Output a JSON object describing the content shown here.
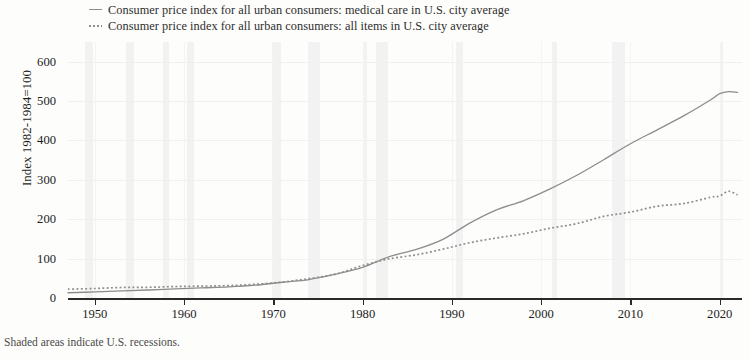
{
  "legend": {
    "items": [
      {
        "marker": "solid-line-marker",
        "label": "Consumer price index for all urban consumers: medical care in U.S. city average"
      },
      {
        "marker": "dotted-line-marker",
        "label": "Consumer price index for all urban consumers: all items in U.S. city average"
      }
    ]
  },
  "axes": {
    "ylabel": "Index 1982-1984=100",
    "yticks": [
      "0",
      "100",
      "200",
      "300",
      "400",
      "500",
      "600"
    ],
    "xticks": [
      "1950",
      "1960",
      "1970",
      "1980",
      "1990",
      "2000",
      "2010",
      "2020"
    ]
  },
  "footnote": "Shaded areas indicate U.S. recessions.",
  "colors": {
    "line": "#8d8d8d",
    "axis": "#2a2a2a",
    "recession": "#ececec",
    "background": "#fdfdfb",
    "grid": "#f2f0ee"
  },
  "chart_data": {
    "type": "line",
    "title": "",
    "xlabel": "",
    "ylabel": "Index 1982-1984=100",
    "xlim": [
      1947,
      2022.5
    ],
    "ylim": [
      0,
      650
    ],
    "yticks": [
      0,
      100,
      200,
      300,
      400,
      500,
      600
    ],
    "xticks": [
      1950,
      1960,
      1970,
      1980,
      1990,
      2000,
      2010,
      2020
    ],
    "grid": true,
    "legend_position": "top-left-outside",
    "recessions": [
      [
        1948.9,
        1949.8
      ],
      [
        1953.5,
        1954.4
      ],
      [
        1957.6,
        1958.3
      ],
      [
        1960.3,
        1961.1
      ],
      [
        1969.9,
        1970.9
      ],
      [
        1973.9,
        1975.2
      ],
      [
        1980.0,
        1980.5
      ],
      [
        1981.5,
        1982.9
      ],
      [
        1990.5,
        1991.2
      ],
      [
        2001.2,
        2001.8
      ],
      [
        2007.9,
        2009.4
      ],
      [
        2020.1,
        2020.4
      ]
    ],
    "series": [
      {
        "name": "Consumer price index for all urban consumers: medical care in U.S. city average",
        "style": "solid",
        "x": [
          1947,
          1950,
          1953,
          1956,
          1959,
          1962,
          1965,
          1968,
          1971,
          1974,
          1977,
          1980,
          1983,
          1986,
          1989,
          1992,
          1995,
          1998,
          2001,
          2004,
          2007,
          2010,
          2013,
          2016,
          2019,
          2020,
          2021,
          2022
        ],
        "y": [
          13.3,
          15.4,
          18.2,
          20.2,
          23.3,
          25.9,
          28.2,
          32.5,
          40.0,
          46.8,
          60.8,
          77.7,
          105.0,
          123.4,
          149.1,
          190.1,
          223.8,
          246.9,
          277.0,
          311.6,
          351.1,
          391.6,
          427.1,
          463.0,
          503.5,
          519.0,
          524.0,
          522.0
        ]
      },
      {
        "name": "Consumer price index for all urban consumers: all items in U.S. city average",
        "style": "dotted",
        "x": [
          1947,
          1950,
          1953,
          1956,
          1959,
          1962,
          1965,
          1968,
          1971,
          1974,
          1977,
          1980,
          1983,
          1986,
          1989,
          1992,
          1995,
          1998,
          2001,
          2004,
          2007,
          2010,
          2013,
          2016,
          2019,
          2020,
          2021,
          2022
        ],
        "y": [
          22.3,
          24.1,
          26.7,
          27.2,
          29.1,
          30.2,
          31.5,
          34.8,
          40.5,
          49.3,
          60.6,
          82.4,
          99.6,
          109.6,
          124.0,
          140.3,
          152.4,
          163.0,
          177.1,
          188.9,
          207.3,
          218.1,
          233.0,
          240.0,
          255.7,
          258.8,
          271.0,
          262.0
        ]
      }
    ]
  }
}
